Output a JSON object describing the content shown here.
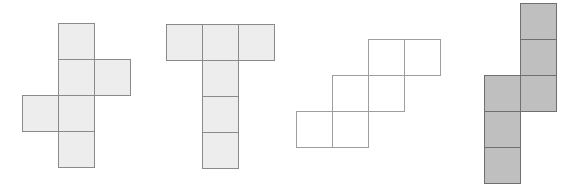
{
  "figure": {
    "background": "#ffffff",
    "cell_size": 36,
    "shapes": [
      {
        "name": "zigzag-cross-hexomino",
        "fill": "#ededed",
        "border": "#8a8a8a",
        "origin": {
          "x": 22,
          "y": 23
        },
        "cells": [
          [
            1,
            0
          ],
          [
            1,
            1
          ],
          [
            2,
            1
          ],
          [
            0,
            2
          ],
          [
            1,
            2
          ],
          [
            1,
            3
          ]
        ]
      },
      {
        "name": "t-hexomino",
        "fill": "#ededed",
        "border": "#8a8a8a",
        "origin": {
          "x": 166,
          "y": 24
        },
        "cells": [
          [
            0,
            0
          ],
          [
            1,
            0
          ],
          [
            2,
            0
          ],
          [
            1,
            1
          ],
          [
            1,
            2
          ],
          [
            1,
            3
          ]
        ]
      },
      {
        "name": "staircase-hexomino",
        "fill": "#ffffff",
        "border": "#9e9e9e",
        "origin": {
          "x": 296,
          "y": 39
        },
        "cells": [
          [
            2,
            0
          ],
          [
            3,
            0
          ],
          [
            1,
            1
          ],
          [
            2,
            1
          ],
          [
            0,
            2
          ],
          [
            1,
            2
          ]
        ]
      },
      {
        "name": "s-hexomino",
        "fill": "#bfbfbf",
        "border": "#6f6f6f",
        "origin": {
          "x": 484,
          "y": 3
        },
        "cells": [
          [
            1,
            0
          ],
          [
            1,
            1
          ],
          [
            0,
            2
          ],
          [
            1,
            2
          ],
          [
            0,
            3
          ],
          [
            0,
            4
          ]
        ]
      }
    ]
  }
}
